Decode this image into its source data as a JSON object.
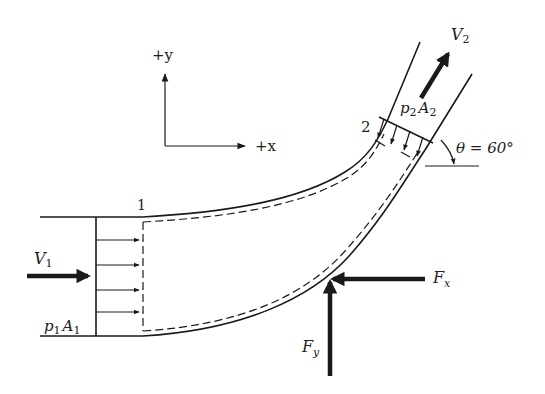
{
  "figure": {
    "axes": {
      "y_label": "+y",
      "x_label": "+x"
    },
    "sections": {
      "inlet": {
        "number": "1",
        "velocity": {
          "symbol": "V",
          "subscript": "1"
        },
        "pressure_force": {
          "p": "p",
          "p_sub": "1",
          "A": "A",
          "A_sub": "1"
        },
        "pressure_arrow_count": 4
      },
      "outlet": {
        "number": "2",
        "velocity": {
          "symbol": "V",
          "subscript": "2"
        },
        "pressure_force": {
          "p": "p",
          "p_sub": "2",
          "A": "A",
          "A_sub": "2"
        },
        "pressure_arrow_count": 4,
        "angle_label": "θ = 60°",
        "angle_degrees": 60
      }
    },
    "forces": {
      "fx": {
        "symbol": "F",
        "subscript": "x",
        "direction": "-x"
      },
      "fy": {
        "symbol": "F",
        "subscript": "y",
        "direction": "+y"
      }
    },
    "colors": {
      "ink": "#1a1a1a",
      "background": "#ffffff"
    }
  }
}
